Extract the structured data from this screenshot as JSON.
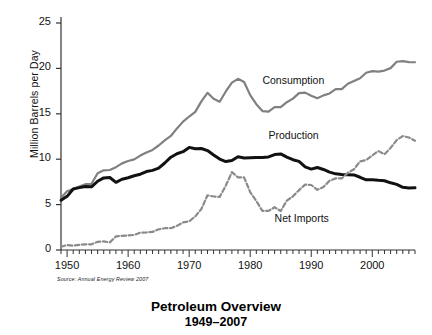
{
  "chart_data": {
    "type": "line",
    "title": "Petroleum Overview",
    "subtitle": "1949–2007",
    "source": "Source:  Annual Energy Review 2007",
    "xlabel": "",
    "ylabel": "Million Barrels per Day",
    "xlim": [
      1949,
      2007
    ],
    "ylim": [
      0,
      25
    ],
    "yticks": [
      0,
      5,
      10,
      15,
      20,
      25
    ],
    "ytick_labels": [
      "0",
      "5",
      "10",
      "15",
      "20",
      "25"
    ],
    "xticks": [
      1950,
      1960,
      1970,
      1980,
      1990,
      2000
    ],
    "xtick_labels": [
      "1950",
      "1960",
      "1970",
      "1980",
      "1990",
      "2000"
    ],
    "minor_xticks_interval": 1,
    "grid": false,
    "legend_position": "inline-annotations",
    "x": [
      1949,
      1950,
      1951,
      1952,
      1953,
      1954,
      1955,
      1956,
      1957,
      1958,
      1959,
      1960,
      1961,
      1962,
      1963,
      1964,
      1965,
      1966,
      1967,
      1968,
      1969,
      1970,
      1971,
      1972,
      1973,
      1974,
      1975,
      1976,
      1977,
      1978,
      1979,
      1980,
      1981,
      1982,
      1983,
      1984,
      1985,
      1986,
      1987,
      1988,
      1989,
      1990,
      1991,
      1992,
      1993,
      1994,
      1995,
      1996,
      1997,
      1998,
      1999,
      2000,
      2001,
      2002,
      2003,
      2004,
      2005,
      2006,
      2007
    ],
    "series": [
      {
        "name": "Consumption",
        "color": "#808080",
        "style": "solid",
        "width": 2.2,
        "label_x": 1982,
        "label_y": 18.6,
        "values": [
          5.76,
          6.46,
          6.72,
          7.0,
          7.25,
          7.29,
          8.46,
          8.78,
          8.81,
          9.12,
          9.54,
          9.8,
          9.98,
          10.4,
          10.74,
          11.02,
          11.51,
          12.08,
          12.56,
          13.39,
          14.14,
          14.7,
          15.21,
          16.37,
          17.31,
          16.65,
          16.32,
          17.46,
          18.43,
          18.85,
          18.51,
          17.06,
          16.06,
          15.3,
          15.23,
          15.73,
          15.73,
          16.28,
          16.67,
          17.28,
          17.33,
          16.99,
          16.71,
          17.03,
          17.24,
          17.72,
          17.72,
          18.31,
          18.62,
          18.92,
          19.52,
          19.7,
          19.65,
          19.76,
          20.03,
          20.73,
          20.8,
          20.69,
          20.68
        ]
      },
      {
        "name": "Production",
        "color": "#111111",
        "style": "solid",
        "width": 3.0,
        "label_x": 1983,
        "label_y": 12.6,
        "values": [
          5.48,
          5.91,
          6.72,
          6.87,
          7.0,
          6.96,
          7.57,
          7.94,
          7.98,
          7.45,
          7.79,
          7.96,
          8.18,
          8.35,
          8.64,
          8.77,
          9.01,
          9.58,
          10.22,
          10.6,
          10.83,
          11.3,
          11.16,
          11.18,
          10.95,
          10.46,
          10.01,
          9.74,
          9.86,
          10.27,
          10.14,
          10.17,
          10.18,
          10.2,
          10.25,
          10.51,
          10.58,
          10.23,
          9.94,
          9.76,
          9.16,
          8.91,
          9.08,
          8.87,
          8.58,
          8.39,
          8.32,
          8.29,
          8.27,
          8.01,
          7.73,
          7.73,
          7.67,
          7.63,
          7.4,
          7.23,
          6.9,
          6.84,
          6.86
        ]
      },
      {
        "name": "Net Imports",
        "color": "#8a8a8a",
        "style": "dashed",
        "width": 2.2,
        "label_x": 1984,
        "label_y": 3.4,
        "values": [
          0.36,
          0.55,
          0.48,
          0.57,
          0.62,
          0.63,
          0.9,
          0.94,
          0.84,
          1.5,
          1.55,
          1.61,
          1.66,
          1.92,
          1.93,
          1.99,
          2.28,
          2.4,
          2.4,
          2.66,
          3.04,
          3.16,
          3.7,
          4.52,
          6.03,
          5.89,
          5.85,
          7.09,
          8.57,
          8.0,
          7.99,
          6.37,
          5.4,
          4.3,
          4.31,
          4.71,
          4.29,
          5.44,
          5.91,
          6.59,
          7.2,
          7.16,
          6.63,
          6.94,
          7.62,
          7.89,
          7.89,
          8.5,
          8.89,
          9.76,
          9.91,
          10.42,
          10.9,
          10.55,
          11.24,
          12.1,
          12.55,
          12.39,
          12.04
        ]
      }
    ]
  }
}
